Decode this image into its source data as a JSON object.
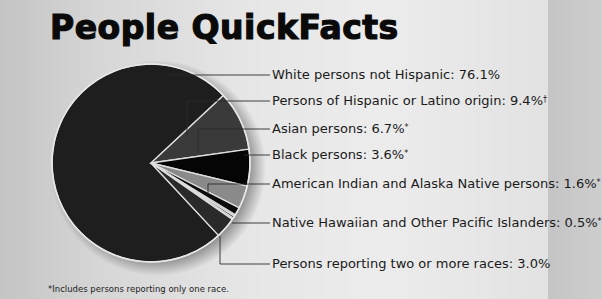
{
  "title": "People QuickFacts",
  "footnote": "*Includes persons reporting only one race.",
  "chart_data": {
    "type": "pie",
    "title": "People QuickFacts",
    "slices": [
      {
        "label": "White persons not Hispanic",
        "value": 76.1,
        "display": "White persons not Hispanic: 76.1%",
        "color": "#1e1e1e"
      },
      {
        "label": "Persons of Hispanic or Latino origin",
        "value": 9.4,
        "display": "Persons of Hispanic or Latino origin: 9.4%",
        "mark": "†",
        "color": "#3a3a3a"
      },
      {
        "label": "Asian persons",
        "value": 6.7,
        "display": "Asian persons: 6.7%",
        "mark": "*",
        "color": "#3a3a3a"
      },
      {
        "label": "Black persons",
        "value": 3.6,
        "display": "Black persons: 3.6%",
        "mark": "*",
        "color": "#050505"
      },
      {
        "label": "American Indian and Alaska Native persons",
        "value": 1.6,
        "display": "American Indian and Alaska Native persons: 1.6%",
        "mark": "*",
        "color": "#8a8a8a"
      },
      {
        "label": "Native Hawaiian and Other Pacific Islanders",
        "value": 0.5,
        "display": "Native Hawaiian and Other Pacific Islanders: 0.5%",
        "mark": "*",
        "color": "#0a0a0a"
      },
      {
        "label": "Persons reporting two or more races",
        "value": 3.0,
        "display": "Persons reporting two or more races: 3.0%",
        "color": "#2a2a2a"
      }
    ],
    "legend_position": "right",
    "footnote": "*Includes persons reporting only one race."
  }
}
